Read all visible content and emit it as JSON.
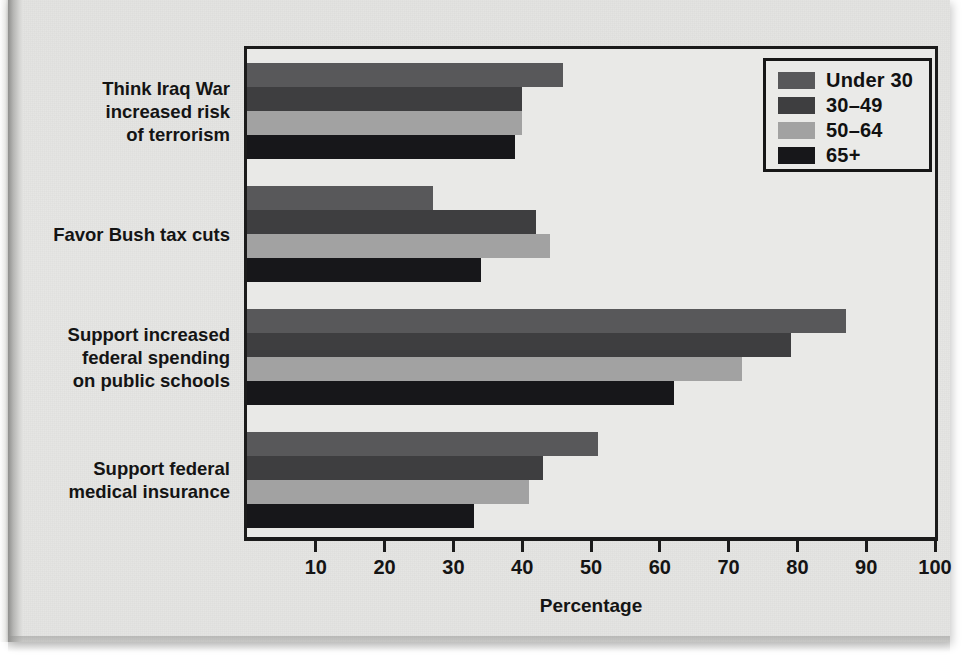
{
  "chart_data": {
    "type": "bar",
    "orientation": "horizontal",
    "title": "",
    "xlabel": "Percentage",
    "ylabel": "",
    "xlim": [
      0,
      100
    ],
    "xticks": [
      10,
      20,
      30,
      40,
      50,
      60,
      70,
      80,
      90,
      100
    ],
    "grid": false,
    "legend_position": "top-right",
    "categories": [
      "Think Iraq War increased risk of terrorism",
      "Favor Bush tax cuts",
      "Support increased federal spending on public schools",
      "Support federal medical insurance"
    ],
    "category_lines": [
      [
        "Think Iraq War",
        "increased risk",
        "of terrorism"
      ],
      [
        "Favor Bush tax cuts"
      ],
      [
        "Support increased",
        "federal spending",
        "on public schools"
      ],
      [
        "Support federal",
        "medical insurance"
      ]
    ],
    "series": [
      {
        "name": "Under 30",
        "color": "#58585a",
        "values": [
          46,
          27,
          87,
          51
        ]
      },
      {
        "name": "30–49",
        "color": "#3e3e40",
        "values": [
          40,
          42,
          79,
          43
        ]
      },
      {
        "name": "50–64",
        "color": "#a2a2a2",
        "values": [
          40,
          44,
          72,
          41
        ]
      },
      {
        "name": "65+",
        "color": "#17171a",
        "values": [
          39,
          34,
          62,
          33
        ]
      }
    ]
  },
  "legend": {
    "items": [
      {
        "label": "Under 30"
      },
      {
        "label": "30–49"
      },
      {
        "label": "50–64"
      },
      {
        "label": "65+"
      }
    ]
  },
  "axis": {
    "x_title": "Percentage",
    "tick_labels": [
      "10",
      "20",
      "30",
      "40",
      "50",
      "60",
      "70",
      "80",
      "90",
      "100"
    ]
  }
}
